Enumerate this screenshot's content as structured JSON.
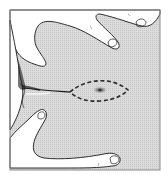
{
  "figure": {
    "subject": "skin-stretching-with-fingers-elliptical-excision",
    "colors": {
      "background": "#ffffff",
      "frame": "#8a8a8a",
      "skin": "#d6d6d6",
      "outline": "#1a1a1a",
      "dashed_ellipse": "#2a2a2a",
      "lesion": "#555555"
    },
    "elements": {
      "frame": "rectangular border",
      "upper_fingers": "two fingers stretching skin from upper side",
      "lower_fingers": "two fingers stretching skin from lower side",
      "skin_fold": "dark crease line extending from left edge to lesion",
      "excision_outline": "dashed lens-shaped ellipse",
      "lesion": "dark spot at ellipse center"
    }
  }
}
